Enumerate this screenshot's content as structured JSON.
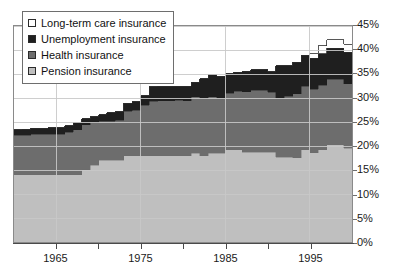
{
  "chart_data": {
    "type": "area",
    "title": "",
    "subtitle": "",
    "xlabel": "",
    "ylabel": "",
    "stacked": true,
    "grid": true,
    "legend_position": "top-left",
    "xlim": [
      1960,
      1999
    ],
    "ylim": [
      0,
      45
    ],
    "y_tick_labels": [
      "0%",
      "5%",
      "10%",
      "15%",
      "20%",
      "25%",
      "30%",
      "35%",
      "40%",
      "45%"
    ],
    "y_tick_values": [
      0,
      5,
      10,
      15,
      20,
      25,
      30,
      35,
      40,
      45
    ],
    "x_tick_values": [
      1965,
      1970,
      1975,
      1980,
      1985,
      1990,
      1995
    ],
    "x_tick_labels": [
      "1965",
      "",
      "1975",
      "",
      "1985",
      "",
      "1995"
    ],
    "x": [
      1960,
      1961,
      1962,
      1963,
      1964,
      1965,
      1966,
      1967,
      1968,
      1969,
      1970,
      1971,
      1972,
      1973,
      1974,
      1975,
      1976,
      1977,
      1978,
      1979,
      1980,
      1981,
      1982,
      1983,
      1984,
      1985,
      1986,
      1987,
      1988,
      1989,
      1990,
      1991,
      1992,
      1993,
      1994,
      1995,
      1996,
      1997,
      1998,
      1999
    ],
    "series": [
      {
        "name": "Pension insurance",
        "color": "#bfbfbf",
        "values": [
          14.0,
          14.0,
          14.0,
          14.0,
          14.0,
          14.0,
          14.0,
          14.0,
          15.0,
          16.0,
          17.0,
          17.0,
          17.0,
          18.0,
          18.0,
          18.0,
          18.0,
          18.0,
          18.0,
          18.0,
          18.0,
          18.5,
          18.0,
          18.5,
          18.5,
          19.2,
          19.2,
          18.7,
          18.7,
          18.7,
          18.7,
          17.7,
          17.7,
          17.5,
          19.2,
          18.6,
          19.2,
          20.3,
          20.3,
          19.5
        ]
      },
      {
        "name": "Health insurance",
        "color": "#6d6d6d",
        "values": [
          8.2,
          8.2,
          8.4,
          8.4,
          8.5,
          8.5,
          8.9,
          9.4,
          9.4,
          8.8,
          8.2,
          8.2,
          8.4,
          9.2,
          9.5,
          10.5,
          11.3,
          11.4,
          11.4,
          11.5,
          11.4,
          11.8,
          12.0,
          11.8,
          11.4,
          11.8,
          12.2,
          12.6,
          12.9,
          12.9,
          12.5,
          12.2,
          12.7,
          13.4,
          13.2,
          13.2,
          13.5,
          13.6,
          13.6,
          13.5
        ]
      },
      {
        "name": "Unemployment insurance",
        "color": "#1f1f1f",
        "values": [
          1.2,
          1.3,
          1.3,
          1.3,
          1.3,
          1.3,
          1.3,
          1.4,
          1.3,
          1.3,
          1.3,
          1.7,
          1.7,
          1.7,
          1.7,
          2.0,
          3.0,
          3.0,
          3.0,
          3.0,
          3.0,
          3.0,
          4.0,
          4.6,
          4.6,
          4.1,
          4.0,
          4.3,
          4.3,
          4.3,
          4.3,
          6.8,
          6.3,
          6.5,
          6.5,
          6.5,
          6.5,
          6.5,
          6.5,
          6.5
        ]
      },
      {
        "name": "Long-term care insurance",
        "color": "#ffffff",
        "values": [
          0,
          0,
          0,
          0,
          0,
          0,
          0,
          0,
          0,
          0,
          0,
          0,
          0,
          0,
          0,
          0,
          0,
          0,
          0,
          0,
          0,
          0,
          0,
          0,
          0,
          0,
          0,
          0,
          0,
          0,
          0,
          0,
          0,
          0,
          0,
          1.0,
          1.7,
          1.7,
          1.7,
          1.7
        ]
      }
    ],
    "legend_entries": [
      {
        "label": "Long-term care insurance",
        "color": "#ffffff"
      },
      {
        "label": "Unemployment insurance",
        "color": "#1f1f1f"
      },
      {
        "label": "Health insurance",
        "color": "#6d6d6d"
      },
      {
        "label": "Pension insurance",
        "color": "#bfbfbf"
      }
    ],
    "colors": {
      "grid": "#c8c8c8",
      "frame": "#8a8a8a",
      "axis": "#4a4a4a",
      "text": "#1a1a1a"
    }
  }
}
